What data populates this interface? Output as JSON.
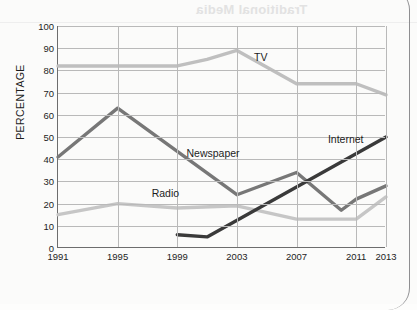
{
  "page": {
    "bleed_heading": "Traditional Media",
    "bleed_body": ""
  },
  "chart_data": {
    "type": "line",
    "title": "",
    "xlabel": "",
    "ylabel": "PERCENTAGE",
    "ylim": [
      0,
      100
    ],
    "ytick_step": 10,
    "yticks": [
      0,
      10,
      20,
      30,
      40,
      50,
      60,
      70,
      80,
      90,
      100
    ],
    "xticks": [
      1991,
      1995,
      1999,
      2003,
      2007,
      2011,
      2013
    ],
    "xlim": [
      1991,
      2013
    ],
    "grid": true,
    "legend": "inline-labels",
    "series": [
      {
        "name": "TV",
        "color": "#bfbfbf",
        "label_x": 2004.6,
        "label_y": 86,
        "x": [
          1991,
          1995,
          1999,
          2001,
          2003,
          2007,
          2011,
          2013
        ],
        "values": [
          82,
          82,
          82,
          85,
          89,
          74,
          74,
          69
        ]
      },
      {
        "name": "Newspaper",
        "color": "#777777",
        "label_x": 2001.4,
        "label_y": 43,
        "x": [
          1991,
          1995,
          2003,
          2007,
          2010,
          2011,
          2013
        ],
        "values": [
          41,
          63,
          24,
          34,
          17,
          22,
          28
        ]
      },
      {
        "name": "Radio",
        "color": "#c6c6c6",
        "label_x": 1998.2,
        "label_y": 25,
        "x": [
          1991,
          1995,
          1999,
          2003,
          2007,
          2011,
          2013
        ],
        "values": [
          15,
          20,
          18,
          19,
          13,
          13,
          23
        ]
      },
      {
        "name": "Internet",
        "color": "#3a3a3a",
        "label_x": 2010.3,
        "label_y": 49,
        "x": [
          1999,
          2001,
          2013
        ],
        "values": [
          6,
          5,
          50
        ]
      }
    ]
  }
}
